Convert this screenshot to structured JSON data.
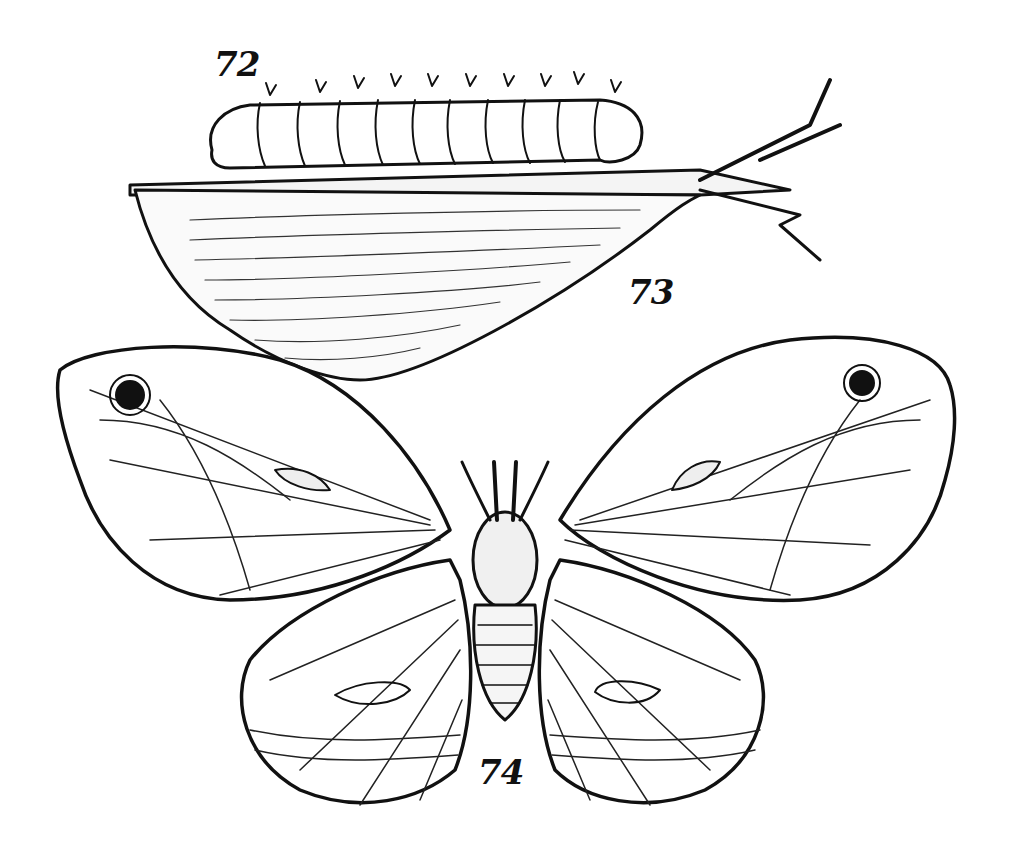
{
  "figure": {
    "labels": [
      {
        "id": "72",
        "text": "72",
        "subject": "caterpillar"
      },
      {
        "id": "73",
        "text": "73",
        "subject": "cocoon"
      },
      {
        "id": "74",
        "text": "74",
        "subject": "moth"
      }
    ],
    "colors": {
      "ink": "#111111",
      "paper": "#ffffff"
    }
  }
}
